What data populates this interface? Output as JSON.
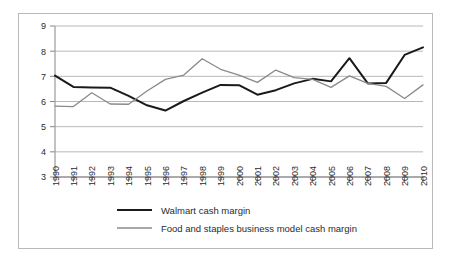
{
  "chart_data": {
    "type": "line",
    "title": "",
    "xlabel": "",
    "ylabel": "",
    "ylim": [
      3,
      9
    ],
    "yticks": [
      3,
      4,
      5,
      6,
      7,
      8,
      9
    ],
    "grid": true,
    "legend_position": "bottom",
    "categories": [
      "1990",
      "1991",
      "1992",
      "1993",
      "1994",
      "1995",
      "1996",
      "1997",
      "1998",
      "1999",
      "2000",
      "2001",
      "2002",
      "2003",
      "2004",
      "2005",
      "2006",
      "2007",
      "2008",
      "2009",
      "2010"
    ],
    "series": [
      {
        "name": "Walmart cash margin",
        "color": "#1a1a1a",
        "width": 2.0,
        "values": [
          7.03,
          6.58,
          6.56,
          6.55,
          6.22,
          5.85,
          5.64,
          6.02,
          6.35,
          6.66,
          6.65,
          6.27,
          6.45,
          6.72,
          6.9,
          6.8,
          7.72,
          6.72,
          6.74,
          7.85,
          8.15
        ]
      },
      {
        "name": "Food and staples business model cash margin",
        "color": "#8a8a8a",
        "width": 1.3,
        "values": [
          5.82,
          5.8,
          6.35,
          5.9,
          5.89,
          6.42,
          6.88,
          7.05,
          7.7,
          7.28,
          7.05,
          6.76,
          7.25,
          6.95,
          6.88,
          6.56,
          7.02,
          6.72,
          6.6,
          6.12,
          6.66
        ]
      }
    ]
  },
  "legend": {
    "items": [
      {
        "label": "Walmart cash margin"
      },
      {
        "label": "Food and staples business model cash margin"
      }
    ]
  }
}
